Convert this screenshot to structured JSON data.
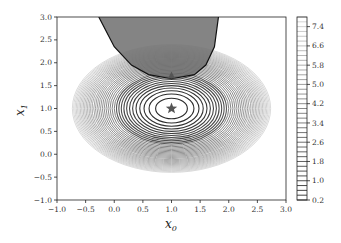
{
  "chart_data": {
    "type": "contour",
    "title": "",
    "xlabel": "x_0",
    "ylabel": "x_1",
    "xlim": [
      -1.0,
      3.0
    ],
    "ylim": [
      -1.0,
      3.0
    ],
    "xticks": [
      "-1.0",
      "-0.5",
      "0.0",
      "0.5",
      "1.0",
      "1.5",
      "2.0",
      "2.5",
      "3.0"
    ],
    "yticks": [
      "-1.0",
      "-0.5",
      "0.0",
      "0.5",
      "1.0",
      "1.5",
      "2.0",
      "2.5",
      "3.0"
    ],
    "grid": false,
    "contour_center": [
      1.0,
      1.0
    ],
    "contour_levels": {
      "min": 0.2,
      "max": 7.8,
      "step": 0.2
    },
    "colorbar": {
      "ticks": [
        "0.2",
        "1.0",
        "1.8",
        "2.6",
        "3.4",
        "4.2",
        "5.0",
        "5.8",
        "6.6",
        "7.4"
      ],
      "position": "right"
    },
    "infeasible_region": {
      "description": "shaded dark gray region at top bounded by a curve",
      "boundary_points": [
        [
          -0.27,
          3.0
        ],
        [
          0.0,
          2.35
        ],
        [
          0.3,
          1.95
        ],
        [
          0.6,
          1.74
        ],
        [
          1.0,
          1.65
        ],
        [
          1.4,
          1.74
        ],
        [
          1.6,
          1.95
        ],
        [
          1.75,
          2.35
        ],
        [
          1.82,
          3.0
        ]
      ]
    },
    "markers": [
      {
        "type": "star",
        "x": 1.0,
        "y": 1.0,
        "label": "unconstrained optimum"
      },
      {
        "type": "triangle",
        "x": 1.0,
        "y": 1.72,
        "label": "constrained optimum"
      }
    ]
  },
  "colors": {
    "contour_line": "#3a3a3a",
    "shaded_region": "#6e6e6e",
    "marker": "#555555",
    "frame": "#222222"
  }
}
